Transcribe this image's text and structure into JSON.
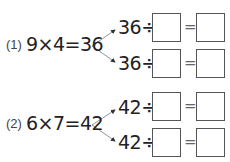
{
  "problems": [
    {
      "label": "(1)",
      "equation": "9×4=36",
      "rows": [
        {
          "dividend": "36÷",
          "equals": "=",
          "divisor_answer": "",
          "quotient_answer": ""
        },
        {
          "dividend": "36÷",
          "equals": "=",
          "divisor_answer": "",
          "quotient_answer": ""
        }
      ]
    },
    {
      "label": "(2)",
      "equation": "6×7=42",
      "rows": [
        {
          "dividend": "42÷",
          "equals": "=",
          "divisor_answer": "",
          "quotient_answer": ""
        },
        {
          "dividend": "42÷",
          "equals": "=",
          "divisor_answer": "",
          "quotient_answer": ""
        }
      ]
    }
  ]
}
